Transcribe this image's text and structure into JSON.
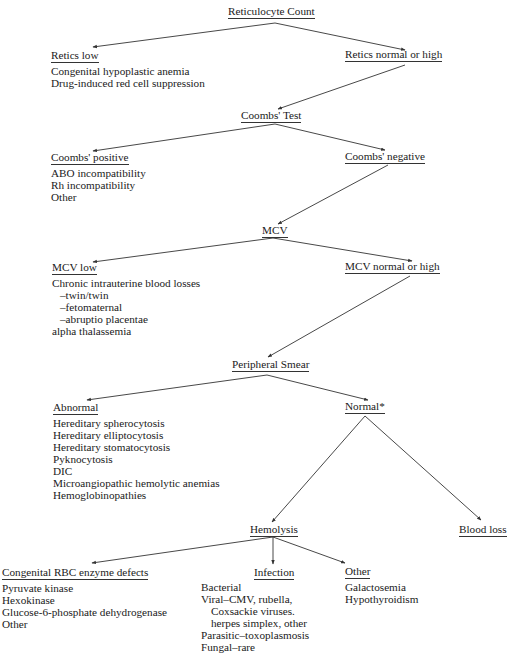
{
  "title": "Reticulocyte Count",
  "nodes": {
    "retic_count": {
      "label": "Reticulocyte Count"
    },
    "retics_low": {
      "label": "Retics low",
      "items": [
        "Congenital hypoplastic anemia",
        "Drug-induced red cell suppression"
      ]
    },
    "retics_normal_high": {
      "label": "Retics normal or high"
    },
    "coombs_test": {
      "label": "Coombs' Test"
    },
    "coombs_positive": {
      "label": "Coombs' positive",
      "items": [
        "ABO incompatibility",
        "Rh incompatibility",
        "Other"
      ]
    },
    "coombs_negative": {
      "label": "Coombs' negative"
    },
    "mcv": {
      "label": "MCV"
    },
    "mcv_low": {
      "label": "MCV low",
      "items": [
        "Chronic intrauterine blood losses",
        "–twin/twin",
        "–fetomaternal",
        "–abruptio placentae",
        "alpha thalassemia"
      ]
    },
    "mcv_normal_high": {
      "label": "MCV normal or high"
    },
    "peripheral_smear": {
      "label": "Peripheral Smear"
    },
    "abnormal": {
      "label": "Abnormal",
      "items": [
        "Hereditary spherocytosis",
        "Hereditary elliptocytosis",
        "Hereditary stomatocytosis",
        "Pyknocytosis",
        "DIC",
        "Microangiopathic hemolytic anemias",
        "Hemoglobinopathies"
      ]
    },
    "normal": {
      "label": "Normal*"
    },
    "hemolysis": {
      "label": "Hemolysis"
    },
    "blood_loss": {
      "label": "Blood loss"
    },
    "congenital_rbc": {
      "label": "Congenital RBC enzyme defects",
      "items": [
        "Pyruvate kinase",
        "Hexokinase",
        "Glucose-6-phosphate dehydrogenase",
        "Other"
      ]
    },
    "infection": {
      "label": "Infection",
      "items": [
        "Bacterial",
        "Viral–CMV, rubella,",
        "Coxsackie viruses.",
        "herpes simplex, other",
        "Parasitic–toxoplasmosis",
        "Fungal–rare"
      ]
    },
    "other": {
      "label": "Other",
      "items": [
        "Galactosemia",
        "Hypothyroidism"
      ]
    }
  },
  "edges": [
    {
      "from": "retic_count",
      "to": "retics_low"
    },
    {
      "from": "retic_count",
      "to": "retics_normal_high"
    },
    {
      "from": "retics_normal_high",
      "to": "coombs_test"
    },
    {
      "from": "coombs_test",
      "to": "coombs_positive"
    },
    {
      "from": "coombs_test",
      "to": "coombs_negative"
    },
    {
      "from": "coombs_negative",
      "to": "mcv"
    },
    {
      "from": "mcv",
      "to": "mcv_low"
    },
    {
      "from": "mcv",
      "to": "mcv_normal_high"
    },
    {
      "from": "mcv_normal_high",
      "to": "peripheral_smear"
    },
    {
      "from": "peripheral_smear",
      "to": "abnormal"
    },
    {
      "from": "peripheral_smear",
      "to": "normal"
    },
    {
      "from": "normal",
      "to": "hemolysis"
    },
    {
      "from": "normal",
      "to": "blood_loss"
    },
    {
      "from": "hemolysis",
      "to": "congenital_rbc"
    },
    {
      "from": "hemolysis",
      "to": "infection"
    },
    {
      "from": "hemolysis",
      "to": "other"
    }
  ],
  "colors": {
    "ink": "#1a1a1a",
    "line": "#333333",
    "background": "#ffffff"
  }
}
